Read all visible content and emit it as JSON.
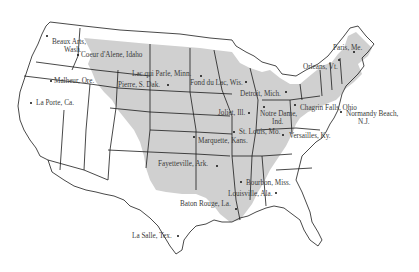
{
  "map": {
    "title": "",
    "shade_color": "#cfcfcf",
    "border_color": "#1a1a1a",
    "background": "#ffffff",
    "places": [
      {
        "name": "Beaux Arts, Wash.",
        "lines": [
          "Beaux Arts,",
          "Wash."
        ],
        "x": 52,
        "y": 38,
        "dot": [
          47,
          36
        ]
      },
      {
        "name": "Coeur d'Alene, Idaho",
        "lines": [
          "Coeur d'Alene, Idaho"
        ],
        "x": 81,
        "y": 51,
        "dot": [
          78,
          55
        ]
      },
      {
        "name": "Malheur, Ore.",
        "lines": [
          "Malheur, Ore."
        ],
        "x": 54,
        "y": 77,
        "dot": [
          51,
          81
        ]
      },
      {
        "name": "La Porte, Ca.",
        "lines": [
          "La Porte, Ca."
        ],
        "x": 36,
        "y": 99,
        "dot": [
          31,
          103
        ]
      },
      {
        "name": "Lac qui Parle, Minn.",
        "lines": [
          "Lac qui Parle, Minn."
        ],
        "x": 132,
        "y": 70,
        "dot": [
          201,
          76
        ]
      },
      {
        "name": "Pierre, S. Dak.",
        "lines": [
          "Pierre, S. Dak."
        ],
        "x": 118,
        "y": 81,
        "dot": [
          168,
          85
        ]
      },
      {
        "name": "Fond du Lac, Wis.",
        "lines": [
          "Fond du Lac, Wis."
        ],
        "x": 190,
        "y": 79,
        "dot": [
          246,
          82
        ]
      },
      {
        "name": "Detroit, Mich.",
        "lines": [
          "Detroit, Mich."
        ],
        "x": 240,
        "y": 90,
        "dot": [
          286,
          92
        ]
      },
      {
        "name": "Joliet, Ill.",
        "lines": [
          "Joliet, Ill."
        ],
        "x": 218,
        "y": 109,
        "dot": [
          249,
          113
        ]
      },
      {
        "name": "Notre Dame, Ind.",
        "lines": [
          "Notre Dame,",
          "Ind."
        ],
        "x": 260,
        "y": 110,
        "dot": [
          264,
          107
        ]
      },
      {
        "name": "Chagrin Falls, Ohio",
        "lines": [
          "Chagrin Falls, Ohio"
        ],
        "x": 300,
        "y": 104,
        "dot": [
          295,
          105
        ]
      },
      {
        "name": "Paris, Me.",
        "lines": [
          "Paris, Me."
        ],
        "x": 333,
        "y": 44,
        "dot": [
          354,
          52
        ]
      },
      {
        "name": "Orleans, Vt.",
        "lines": [
          "Orleans, Vt."
        ],
        "x": 303,
        "y": 63,
        "dot": [
          339,
          60
        ]
      },
      {
        "name": "Normandy Beach, N.J.",
        "lines": [
          "Normandy Beach,",
          "N.J."
        ],
        "x": 346,
        "y": 110,
        "dot": [
          341,
          112
        ]
      },
      {
        "name": "St. Louis, Mo.",
        "lines": [
          "St. Louis, Mo."
        ],
        "x": 239,
        "y": 128,
        "dot": [
          234,
          132
        ]
      },
      {
        "name": "Marquette, Kans.",
        "lines": [
          "Marquette, Kans."
        ],
        "x": 198,
        "y": 137,
        "dot": [
          194,
          137
        ]
      },
      {
        "name": "Versailles, Ky.",
        "lines": [
          "Versailles, Ky."
        ],
        "x": 289,
        "y": 132,
        "dot": [
          283,
          135
        ]
      },
      {
        "name": "Fayetteville, Ark.",
        "lines": [
          "Fayetteville, Ark."
        ],
        "x": 158,
        "y": 160,
        "dot": [
          217,
          166
        ]
      },
      {
        "name": "Bourbon, Miss.",
        "lines": [
          "Bourbon, Miss."
        ],
        "x": 246,
        "y": 179,
        "dot": [
          241,
          182
        ]
      },
      {
        "name": "Louisville, Ala.",
        "lines": [
          "Louisville, Ala."
        ],
        "x": 228,
        "y": 190,
        "dot": [
          276,
          193
        ]
      },
      {
        "name": "Baton Rouge, La.",
        "lines": [
          "Baton Rouge, La."
        ],
        "x": 180,
        "y": 200,
        "dot": [
          236,
          209
        ]
      },
      {
        "name": "La Salle, Tex.",
        "lines": [
          "La Salle, Tex."
        ],
        "x": 132,
        "y": 232,
        "dot": [
          178,
          236
        ]
      }
    ]
  }
}
